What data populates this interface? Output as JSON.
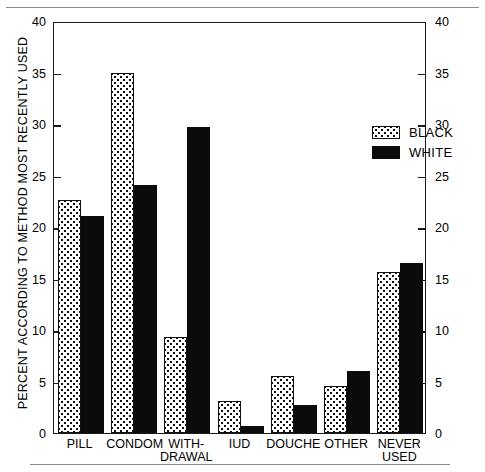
{
  "chart_data": {
    "type": "bar",
    "title": "",
    "xlabel": "",
    "ylabel": "PERCENT ACCORDING TO METHOD MOST RECENTLY USED",
    "ylim": [
      0,
      40
    ],
    "yticks": [
      0,
      5,
      10,
      15,
      20,
      25,
      30,
      35,
      40
    ],
    "ytick_labels": [
      "0",
      "5",
      "10",
      "15",
      "20",
      "25",
      "30",
      "35",
      "40"
    ],
    "right_axis": true,
    "right_ytick_labels": [
      "0",
      "5",
      "10",
      "15",
      "20",
      "25",
      "30",
      "35",
      "40"
    ],
    "grid": false,
    "legend_position": "upper-right-inside",
    "categories": [
      "PILL",
      "CONDOM",
      "WITH-\nDRAWAL",
      "IUD",
      "DOUCHE",
      "OTHER",
      "NEVER\nUSED"
    ],
    "series": [
      {
        "name": "BLACK",
        "pattern": "dotted",
        "values": [
          22.6,
          35.0,
          9.3,
          3.1,
          5.5,
          4.6,
          15.6
        ]
      },
      {
        "name": "WHITE",
        "pattern": "solid",
        "values": [
          21.1,
          24.1,
          29.7,
          0.7,
          2.7,
          6.0,
          16.5
        ]
      }
    ]
  },
  "legend": {
    "items": [
      {
        "label": "BLACK"
      },
      {
        "label": "WHITE"
      }
    ]
  },
  "colors": {
    "ink": "#111111",
    "solid_fill": "#0b0b0b",
    "dotted_fill": "#ffffff",
    "rule": "#8d8d8d"
  }
}
